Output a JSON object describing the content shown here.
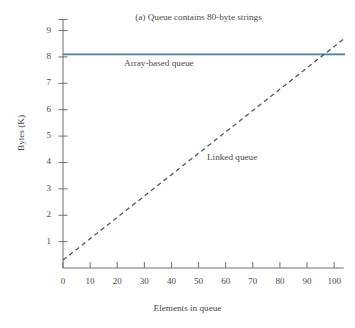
{
  "figure": {
    "title": "(a) Queue contains 80-byte strings",
    "margin_fragments": [
      "r",
      "e"
    ]
  },
  "chart_data": {
    "type": "line",
    "title": "(a) Queue contains 80-byte strings",
    "xlabel": "Elements in queue",
    "ylabel": "Bytes (K)",
    "xlim": [
      0,
      104
    ],
    "ylim": [
      0,
      9.4
    ],
    "xticks": [
      0,
      10,
      20,
      30,
      40,
      50,
      60,
      70,
      80,
      90,
      100
    ],
    "xtick_labels": [
      "0",
      "10",
      "20",
      "30",
      "40",
      "50",
      "60",
      "70",
      "80",
      "90",
      "100"
    ],
    "yticks": [
      1,
      2,
      3,
      4,
      5,
      6,
      7,
      8,
      9
    ],
    "ytick_labels": [
      "1",
      "2",
      "3",
      "4",
      "5",
      "6",
      "7",
      "8",
      "9"
    ],
    "grid": false,
    "legend_position": "inline-annotation",
    "series": [
      {
        "name": "Array-based queue",
        "style": "solid",
        "color": "#4a7f96",
        "x": [
          0,
          104
        ],
        "values": [
          8.1,
          8.1
        ]
      },
      {
        "name": "Linked queue",
        "style": "dashed",
        "color": "#445a72",
        "x": [
          0,
          104
        ],
        "values": [
          0.3,
          8.72
        ]
      }
    ],
    "annotations": [
      {
        "text": "Array-based queue",
        "x": 18,
        "y": 7.55
      },
      {
        "text": "Linked queue",
        "x": 52,
        "y": 4.15
      }
    ],
    "crossing_point": {
      "x": 95,
      "y": 8.1
    }
  },
  "axes": {
    "axis_color": "#6e6e6e"
  }
}
